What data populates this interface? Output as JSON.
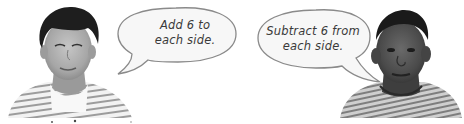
{
  "scene": {
    "left_person": {
      "description": "boy with dark hair in striped shirt",
      "speech": {
        "line1": "Add 6 to",
        "line2": "each side."
      }
    },
    "right_person": {
      "description": "boy with short hair in striped shirt",
      "speech": {
        "line1": "Subtract 6 from",
        "line2": "each side."
      }
    }
  },
  "colors": {
    "bubble_fill": "#f7f7f7",
    "bubble_stroke": "#8a8a8a",
    "text": "#3a3a3a",
    "hair_dark": "#1e1e1e",
    "skin_left": "#a8a8a8",
    "skin_right": "#4a4a4a",
    "shirt_stripe": "#9a9a9a"
  }
}
